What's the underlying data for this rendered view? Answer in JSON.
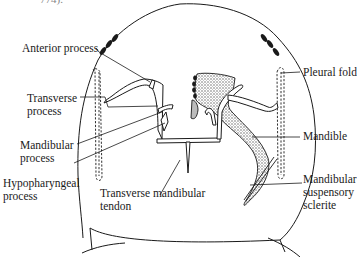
{
  "figure": {
    "top_fragment": "774).",
    "labels": {
      "anterior_process": "Anterior process",
      "transverse_process": [
        "Transverse",
        "process"
      ],
      "mandibular_process": [
        "Mandibular",
        "process"
      ],
      "hypopharyngeal_process": [
        "Hypopharyngeal",
        "process"
      ],
      "transverse_mandibular_tendon": [
        "Transverse mandibular",
        "tendon"
      ],
      "pleural_fold": "Pleural fold",
      "mandible": "Mandible",
      "mandibular_suspensory_sclerite": [
        "Mandibular",
        "suspensory",
        "sclerite"
      ]
    },
    "colors": {
      "ink": "#1a1a1a",
      "stipple": "#9a9a9a",
      "background": "#ffffff"
    }
  }
}
